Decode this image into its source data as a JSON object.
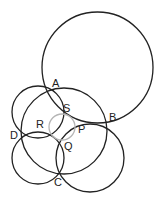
{
  "diagram": {
    "type": "intersecting-circles",
    "stroke_color": "#222222",
    "inner_circle_color": "#b5b5b5",
    "circles": [
      {
        "id": "top-large",
        "cx": 97.5,
        "cy": 67.5,
        "r": 55.5,
        "through": [
          "A",
          "B"
        ]
      },
      {
        "id": "middle-large",
        "cx": 64,
        "cy": 131,
        "r": 43,
        "through": [
          "A",
          "B",
          "C",
          "D"
        ]
      },
      {
        "id": "upper-left",
        "cx": 38,
        "cy": 112,
        "r": 26,
        "through": [
          "A",
          "D",
          "S",
          "R"
        ]
      },
      {
        "id": "lower-left",
        "cx": 38,
        "cy": 158,
        "r": 26,
        "through": [
          "D",
          "C",
          "R",
          "Q"
        ]
      },
      {
        "id": "lower-right",
        "cx": 90,
        "cy": 158,
        "r": 34,
        "through": [
          "B",
          "C",
          "P",
          "Q"
        ]
      },
      {
        "id": "inner-gray",
        "cx": 62,
        "cy": 127,
        "r": 13,
        "through": [
          "P",
          "Q",
          "R",
          "S"
        ]
      }
    ],
    "points": [
      {
        "label": "A",
        "x": 47,
        "y": 92,
        "label_x": 52,
        "label_y": 87
      },
      {
        "label": "B",
        "x": 106,
        "y": 125,
        "label_x": 109,
        "label_y": 121
      },
      {
        "label": "C",
        "x": 58,
        "y": 173,
        "label_x": 54,
        "label_y": 186
      },
      {
        "label": "D",
        "x": 23,
        "y": 135,
        "label_x": 10,
        "label_y": 139
      },
      {
        "label": "S",
        "x": 60,
        "y": 115,
        "label_x": 63,
        "label_y": 112
      },
      {
        "label": "P",
        "x": 76,
        "y": 123,
        "label_x": 78,
        "label_y": 133
      },
      {
        "label": "R",
        "x": 53,
        "y": 136,
        "label_x": 36,
        "label_y": 128
      },
      {
        "label": "Q",
        "x": 58,
        "y": 139,
        "label_x": 64,
        "label_y": 150
      }
    ]
  }
}
